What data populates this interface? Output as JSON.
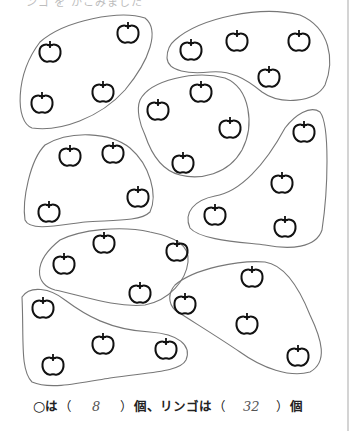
{
  "worksheet": {
    "top_text_partial": "ンゴ を かこみました",
    "answer": {
      "circle_mark": "○",
      "wa1": "は",
      "open1": "（",
      "circle_count": "8",
      "close1": "）",
      "unit1": "個、",
      "ringo_label": "リンゴは",
      "open2": "（",
      "apple_count": "32",
      "close2": "）",
      "unit2": "個"
    },
    "groups": [
      {
        "name": "group-1",
        "apples": [
          [
            128,
            33
          ],
          [
            50,
            52
          ],
          [
            103,
            92
          ],
          [
            42,
            103
          ]
        ]
      },
      {
        "name": "group-2",
        "apples": [
          [
            191,
            50
          ],
          [
            237,
            41
          ],
          [
            299,
            41
          ],
          [
            269,
            77
          ]
        ]
      },
      {
        "name": "group-3",
        "apples": [
          [
            201,
            92
          ],
          [
            158,
            110
          ],
          [
            230,
            128
          ],
          [
            183,
            163
          ]
        ]
      },
      {
        "name": "group-4",
        "apples": [
          [
            70,
            156
          ],
          [
            113,
            153
          ],
          [
            138,
            197
          ],
          [
            49,
            212
          ]
        ]
      },
      {
        "name": "group-5",
        "apples": [
          [
            304,
            132
          ],
          [
            282,
            183
          ],
          [
            215,
            215
          ],
          [
            285,
            227
          ]
        ]
      },
      {
        "name": "group-6",
        "apples": [
          [
            104,
            243
          ],
          [
            64,
            264
          ],
          [
            177,
            251
          ],
          [
            140,
            293
          ]
        ]
      },
      {
        "name": "group-7",
        "apples": [
          [
            43,
            308
          ],
          [
            103,
            344
          ],
          [
            166,
            349
          ],
          [
            53,
            365
          ]
        ]
      },
      {
        "name": "group-8",
        "apples": [
          [
            252,
            277
          ],
          [
            185,
            304
          ],
          [
            247,
            324
          ],
          [
            298,
            356
          ]
        ]
      }
    ],
    "colors": {
      "outline": "#777777",
      "apple": "#111111"
    }
  }
}
